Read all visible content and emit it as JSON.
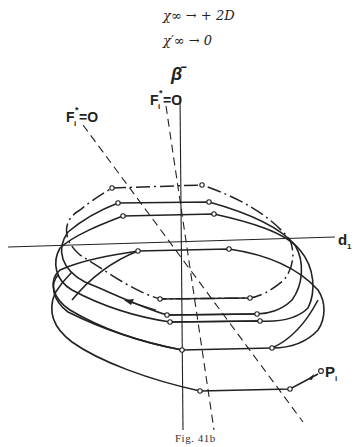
{
  "equations": {
    "line1": "χ∞ → + 2D",
    "line2": "χ′∞ → 0"
  },
  "figure": {
    "axis_vertical_label": "β̄",
    "axis_horizontal_label": "d",
    "axis_horizontal_subscript": "1",
    "left_line_label": "F",
    "left_line_label_sup": "*",
    "left_line_label_sub": "i",
    "left_line_label_eq": "=O",
    "right_line_label": "F",
    "right_line_label_sup": "*",
    "right_line_label_sub": "i",
    "right_line_label_eq": "=O",
    "point_label": "P",
    "point_label_sub": "i"
  },
  "caption": "Fig. 41b"
}
